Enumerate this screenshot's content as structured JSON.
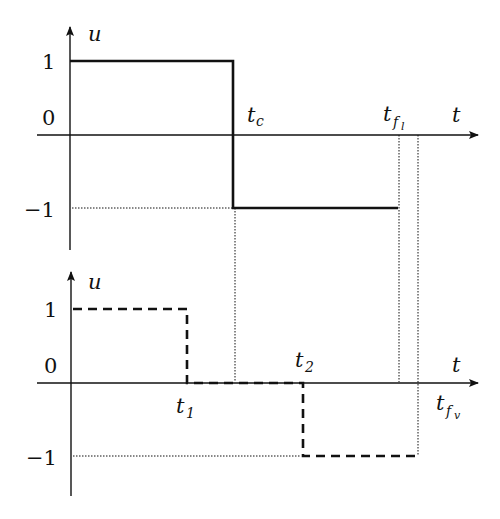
{
  "diagram": {
    "top_plot": {
      "y_axis_label": "u",
      "x_axis_label": "t",
      "tick_labels": {
        "one": "1",
        "zero": "0",
        "minus_one": "−1"
      },
      "time_labels": {
        "tc": {
          "base": "t",
          "sub": "c"
        },
        "tfl": {
          "base": "t",
          "sub": "f",
          "subsub": "l"
        }
      },
      "signal_style": "solid",
      "signal": [
        {
          "t": "0",
          "u": 1
        },
        {
          "t": "t_c",
          "u": 1
        },
        {
          "t": "t_c",
          "u": -1
        },
        {
          "t": "t_fl",
          "u": -1
        }
      ]
    },
    "bottom_plot": {
      "y_axis_label": "u",
      "x_axis_label": "t",
      "tick_labels": {
        "one": "1",
        "zero": "0",
        "minus_one": "−1"
      },
      "time_labels": {
        "t1": {
          "base": "t",
          "sub": "1"
        },
        "t2": {
          "base": "t",
          "sub": "2"
        },
        "tfv": {
          "base": "t",
          "sub": "f",
          "subsub": "v"
        }
      },
      "signal_style": "dashed",
      "signal": [
        {
          "t": "0",
          "u": 1
        },
        {
          "t": "t_1",
          "u": 1
        },
        {
          "t": "t_1",
          "u": 0
        },
        {
          "t": "t_2",
          "u": 0
        },
        {
          "t": "t_2",
          "u": -1
        },
        {
          "t": "t_fv",
          "u": -1
        }
      ]
    },
    "colors": {
      "line": "#111111",
      "background": "#ffffff"
    }
  }
}
